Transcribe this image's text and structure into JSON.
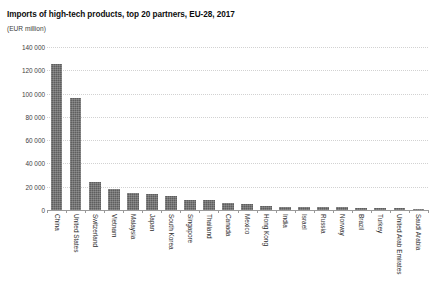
{
  "chart_data": {
    "type": "bar",
    "title": "Imports of high-tech products, top 20 partners, EU-28, 2017",
    "subtitle": "(EUR million)",
    "xlabel": "",
    "ylabel": "",
    "ylim": [
      0,
      140000
    ],
    "ytick_labels": [
      "140 000",
      "120 000",
      "100 000",
      "80 000",
      "60 000",
      "40 000",
      "20 000",
      "0"
    ],
    "ytick_values": [
      140000,
      120000,
      100000,
      80000,
      60000,
      40000,
      20000,
      0
    ],
    "grid": true,
    "legend": "none",
    "bar_color": "#5e5e5e",
    "categories": [
      "China",
      "United States",
      "Switzerland",
      "Vietnam",
      "Malaysia",
      "Japan",
      "South Korea",
      "Singapore",
      "Thailand",
      "Canada",
      "Mexico",
      "Hong Kong",
      "India",
      "Israel",
      "Russia",
      "Norway",
      "Brazil",
      "Turkey",
      "United Arab Emirates",
      "Saudi Arabia"
    ],
    "values": [
      125500,
      96000,
      24000,
      18000,
      14500,
      13500,
      12000,
      8500,
      8200,
      6000,
      5500,
      3200,
      2900,
      2600,
      2400,
      2200,
      2000,
      1800,
      1500,
      1300
    ]
  }
}
